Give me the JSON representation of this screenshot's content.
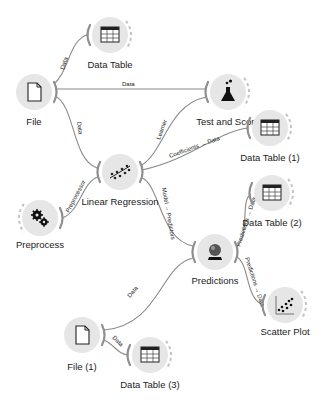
{
  "canvas": {
    "background": "#ffffff",
    "node_fill": "#e6e6e6",
    "link_color": "#8a8a8a",
    "anchor_color": "#8f8f8f"
  },
  "nodes": [
    {
      "id": "data_table",
      "label": "Data Table",
      "icon": "table-icon"
    },
    {
      "id": "file",
      "label": "File",
      "icon": "file-icon"
    },
    {
      "id": "test_score",
      "label": "Test and Score",
      "icon": "flask-icon"
    },
    {
      "id": "data_table_1",
      "label": "Data Table (1)",
      "icon": "table-icon"
    },
    {
      "id": "linear_regression",
      "label": "Linear Regression",
      "icon": "regression-icon"
    },
    {
      "id": "preprocess",
      "label": "Preprocess",
      "icon": "gears-icon"
    },
    {
      "id": "data_table_2",
      "label": "Data Table (2)",
      "icon": "table-icon"
    },
    {
      "id": "predictions",
      "label": "Predictions",
      "icon": "crystal-ball-icon"
    },
    {
      "id": "scatter_plot",
      "label": "Scatter Plot",
      "icon": "scatter-plot-icon"
    },
    {
      "id": "file_1",
      "label": "File (1)",
      "icon": "file-icon"
    },
    {
      "id": "data_table_3",
      "label": "Data Table (3)",
      "icon": "table-icon"
    }
  ],
  "links": [
    {
      "from": "File",
      "to": "Data Table",
      "label": "Data"
    },
    {
      "from": "File",
      "to": "Test and Score",
      "label": "Data"
    },
    {
      "from": "File",
      "to": "Linear Regression",
      "label": "Data"
    },
    {
      "from": "Linear Regression",
      "to": "Test and Score",
      "label": "Learner"
    },
    {
      "from": "Linear Regression",
      "to": "Data Table (1)",
      "label": "Coefficients → Data"
    },
    {
      "from": "Preprocess",
      "to": "Linear Regression",
      "label": "Preprocessor"
    },
    {
      "from": "Linear Regression",
      "to": "Predictions",
      "label": "Model → Predictors"
    },
    {
      "from": "Predictions",
      "to": "Data Table (2)",
      "label": "Predictions → Data"
    },
    {
      "from": "Predictions",
      "to": "Scatter Plot",
      "label": "Predictions → Data"
    },
    {
      "from": "File (1)",
      "to": "Predictions",
      "label": "Data"
    },
    {
      "from": "File (1)",
      "to": "Data Table (3)",
      "label": "Data"
    }
  ]
}
